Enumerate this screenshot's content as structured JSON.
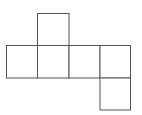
{
  "diagram": {
    "type": "cube-net",
    "line_color": "#555555",
    "background": "#ffffff",
    "faces": [
      {
        "id": "top",
        "col": 1,
        "row": 0
      },
      {
        "id": "row-1",
        "col": 0,
        "row": 1
      },
      {
        "id": "row-2",
        "col": 1,
        "row": 1
      },
      {
        "id": "row-3",
        "col": 2,
        "row": 1
      },
      {
        "id": "row-4",
        "col": 3,
        "row": 1
      },
      {
        "id": "bottom",
        "col": 3,
        "row": 2
      }
    ]
  }
}
